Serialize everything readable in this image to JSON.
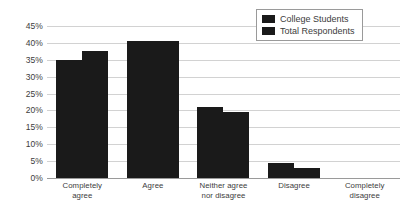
{
  "chart_data": {
    "type": "bar",
    "title": "",
    "subtitle": "",
    "xlabel": "",
    "ylabel": "",
    "ylim": [
      0,
      45
    ],
    "ytick_labels": [
      "45%",
      "40%",
      "35%",
      "30%",
      "25%",
      "20%",
      "15%",
      "10%",
      "5%",
      "0%"
    ],
    "ytick_values": [
      45,
      40,
      35,
      30,
      25,
      20,
      15,
      10,
      5,
      0
    ],
    "grid": true,
    "legend_position": "top-right",
    "categories": [
      "Completely agree",
      "Agree",
      "Neither agree nor disagree",
      "Disagree",
      "Completely disagree"
    ],
    "category_lines": [
      [
        "Completely",
        "agree"
      ],
      [
        "Agree",
        ""
      ],
      [
        "Neither agree",
        "nor disagree"
      ],
      [
        "Disagree",
        ""
      ],
      [
        "Completely",
        "disagree"
      ]
    ],
    "series": [
      {
        "name": "College Students",
        "color": "#1a1a1a",
        "values": [
          35,
          40.5,
          21,
          4.5,
          0
        ]
      },
      {
        "name": "Total Respondents",
        "color": "#1a1a1a",
        "values": [
          37.5,
          40.5,
          19.5,
          3,
          0
        ]
      }
    ]
  },
  "legend": {
    "items": [
      {
        "label": "College Students",
        "swatch": "legend-swatch-college-students"
      },
      {
        "label": "Total Respondents",
        "swatch": "legend-swatch-total-respondents"
      }
    ]
  },
  "colors": {
    "bar": "#1a1a1a",
    "gridline": "#d2d2d2",
    "axis": "#9a9a9a",
    "text": "#3c3c3c",
    "background": "#ffffff"
  }
}
